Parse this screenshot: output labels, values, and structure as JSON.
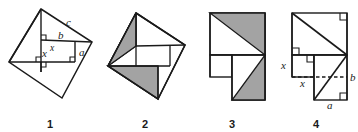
{
  "image": {
    "kind": "geometry-diagram-strip",
    "description": "Four-panel dissection proof of the Pythagorean theorem",
    "width": 358,
    "height": 132,
    "background_color": "#ffffff",
    "stroke_color": "#1a1a1a",
    "shade_color": "#a3a3a3",
    "shade_color_light": "#b5b5b5"
  },
  "figures": [
    {
      "number": "1",
      "caption": "1",
      "labels": [
        {
          "text": "c",
          "role": "hypotenuse-label"
        },
        {
          "text": "b",
          "role": "leg-label"
        },
        {
          "text": "a",
          "role": "leg-label"
        },
        {
          "text": "x",
          "role": "segment-label"
        },
        {
          "text": "x",
          "role": "segment-label"
        }
      ],
      "shaded_regions": 0,
      "right_angle_marks": 4,
      "shape": "rotated-square-with-inscribed-right-triangles"
    },
    {
      "number": "2",
      "caption": "2",
      "labels": [],
      "shaded_regions": 2,
      "right_angle_marks": 0,
      "shape": "rotated-square-pinwheel-dissection-shaded"
    },
    {
      "number": "3",
      "caption": "3",
      "labels": [],
      "shaded_regions": 2,
      "right_angle_marks": 0,
      "shape": "rearranged-squares-on-legs-shaded"
    },
    {
      "number": "4",
      "caption": "4",
      "labels": [
        {
          "text": "x",
          "role": "segment-label-vertical"
        },
        {
          "text": "x",
          "role": "segment-label-horizontal"
        },
        {
          "text": "b",
          "role": "leg-label"
        },
        {
          "text": "a",
          "role": "leg-label"
        }
      ],
      "shaded_regions": 0,
      "right_angle_marks": 5,
      "shape": "two-squares-on-legs-with-diagonals-and-dashed-line"
    }
  ]
}
